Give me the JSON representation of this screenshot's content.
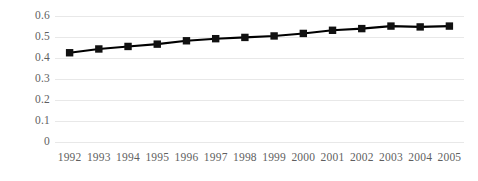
{
  "chart_data": {
    "type": "line",
    "title": "",
    "subtitle": "",
    "xlabel": "",
    "ylabel": "",
    "categories": [
      "1992",
      "1993",
      "1994",
      "1995",
      "1996",
      "1997",
      "1998",
      "1999",
      "2000",
      "2001",
      "2002",
      "2003",
      "2004",
      "2005"
    ],
    "series": [
      {
        "name": "series-1",
        "values": [
          0.425,
          0.443,
          0.455,
          0.466,
          0.482,
          0.492,
          0.498,
          0.505,
          0.517,
          0.532,
          0.54,
          0.552,
          0.548,
          0.552
        ],
        "color": "#000000",
        "marker": "square"
      }
    ],
    "ylim": [
      0,
      0.6
    ],
    "yticks": [
      0,
      0.1,
      0.2,
      0.3,
      0.4,
      0.5,
      0.6
    ],
    "ytick_labels": [
      "0",
      "0.1",
      "0.2",
      "0.3",
      "0.4",
      "0.5",
      "0.6"
    ],
    "grid": "horizontal",
    "gridline_color": "#e8e8e8",
    "legend": "none",
    "legend_position": "",
    "annotations": [],
    "background": "#ffffff",
    "tick_label_color": "#5f5f5f"
  }
}
